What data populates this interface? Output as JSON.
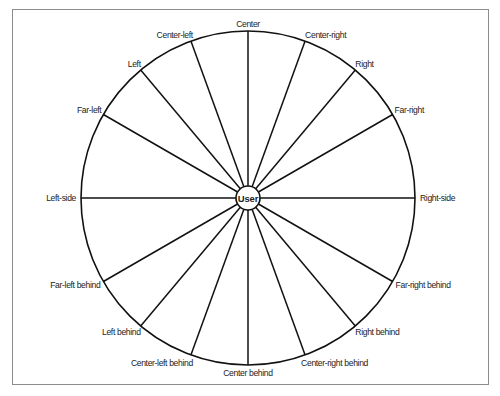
{
  "diagram": {
    "center_label": "User",
    "geometry": {
      "cx": 248,
      "cy": 198,
      "outer_radius": 167,
      "inner_radius": 12
    },
    "colors": {
      "stroke": "#111111",
      "text": "#222222",
      "frame": "#8c8c8c"
    },
    "spokes": [
      {
        "label": "Center",
        "angle": 0,
        "anchor": "middle",
        "dx": 0,
        "dy": -4
      },
      {
        "label": "Center-right",
        "angle": 20,
        "anchor": "start",
        "dx": 0,
        "dy": -3
      },
      {
        "label": "Right",
        "angle": 40,
        "anchor": "start",
        "dx": 0,
        "dy": -3
      },
      {
        "label": "Far-right",
        "angle": 60,
        "anchor": "start",
        "dx": 2,
        "dy": -2
      },
      {
        "label": "Right-side",
        "angle": 90,
        "anchor": "start",
        "dx": 5,
        "dy": 3
      },
      {
        "label": "Far-right behind",
        "angle": 120,
        "anchor": "start",
        "dx": 3,
        "dy": 6
      },
      {
        "label": "Right behind",
        "angle": 140,
        "anchor": "start",
        "dx": 0,
        "dy": 9
      },
      {
        "label": "Center-right behind",
        "angle": 160,
        "anchor": "start",
        "dx": -4,
        "dy": 11
      },
      {
        "label": "Center behind",
        "angle": 180,
        "anchor": "middle",
        "dx": 0,
        "dy": 11
      },
      {
        "label": "Center-left behind",
        "angle": 200,
        "anchor": "end",
        "dx": 2,
        "dy": 11
      },
      {
        "label": "Left behind",
        "angle": 220,
        "anchor": "end",
        "dx": 0,
        "dy": 9
      },
      {
        "label": "Far-left behind",
        "angle": 240,
        "anchor": "end",
        "dx": -3,
        "dy": 6
      },
      {
        "label": "Left-side",
        "angle": 270,
        "anchor": "end",
        "dx": -5,
        "dy": 3
      },
      {
        "label": "Far-left",
        "angle": 300,
        "anchor": "end",
        "dx": -2,
        "dy": -2
      },
      {
        "label": "Left",
        "angle": 320,
        "anchor": "end",
        "dx": 0,
        "dy": -3
      },
      {
        "label": "Center-left",
        "angle": 340,
        "anchor": "end",
        "dx": 2,
        "dy": -3
      }
    ]
  },
  "caption": {
    "text": ""
  }
}
